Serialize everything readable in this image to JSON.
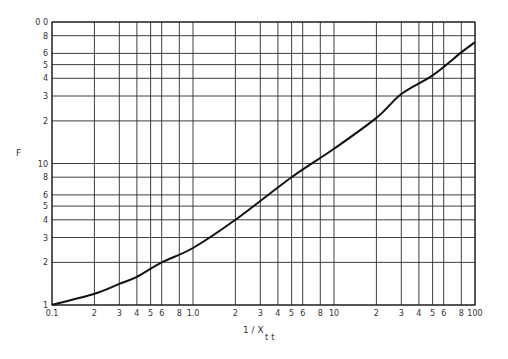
{
  "chart_data": {
    "type": "line",
    "title": "",
    "xlabel": "1 / X",
    "xlabel_subscript": "tt",
    "ylabel": "F",
    "xscale": "log",
    "yscale": "log",
    "xlim": [
      0.1,
      100
    ],
    "ylim": [
      1,
      100
    ],
    "grid": true,
    "legend": null,
    "x_ticks": [
      {
        "v": 0.1,
        "label": "0.1"
      },
      {
        "v": 0.2,
        "label": "2"
      },
      {
        "v": 0.3,
        "label": "3"
      },
      {
        "v": 0.4,
        "label": "4"
      },
      {
        "v": 0.5,
        "label": "5"
      },
      {
        "v": 0.6,
        "label": "6"
      },
      {
        "v": 0.8,
        "label": "8"
      },
      {
        "v": 1.0,
        "label": "1.0"
      },
      {
        "v": 2,
        "label": "2"
      },
      {
        "v": 3,
        "label": "3"
      },
      {
        "v": 4,
        "label": "4"
      },
      {
        "v": 5,
        "label": "5"
      },
      {
        "v": 6,
        "label": "6"
      },
      {
        "v": 8,
        "label": "8"
      },
      {
        "v": 10,
        "label": "10"
      },
      {
        "v": 20,
        "label": "2"
      },
      {
        "v": 30,
        "label": "3"
      },
      {
        "v": 40,
        "label": "4"
      },
      {
        "v": 50,
        "label": "5"
      },
      {
        "v": 60,
        "label": "6"
      },
      {
        "v": 80,
        "label": "8"
      },
      {
        "v": 100,
        "label": "100"
      }
    ],
    "y_ticks": [
      {
        "v": 1,
        "label": "1"
      },
      {
        "v": 2,
        "label": "2"
      },
      {
        "v": 3,
        "label": "3"
      },
      {
        "v": 4,
        "label": "4"
      },
      {
        "v": 5,
        "label": "5"
      },
      {
        "v": 6,
        "label": "6"
      },
      {
        "v": 8,
        "label": "8"
      },
      {
        "v": 10,
        "label": "10"
      },
      {
        "v": 20,
        "label": "2"
      },
      {
        "v": 30,
        "label": "3"
      },
      {
        "v": 40,
        "label": "4"
      },
      {
        "v": 50,
        "label": "5"
      },
      {
        "v": 60,
        "label": "6"
      },
      {
        "v": 80,
        "label": "8"
      },
      {
        "v": 100,
        "label": "0 0"
      }
    ],
    "series": [
      {
        "name": "F",
        "x": [
          0.1,
          0.2,
          0.3,
          0.4,
          0.6,
          1.0,
          2,
          5,
          10,
          20,
          30,
          50,
          80,
          100
        ],
        "y": [
          1.0,
          1.2,
          1.41,
          1.58,
          2.0,
          2.53,
          4.0,
          8.0,
          12.7,
          21,
          31,
          42,
          61,
          72
        ]
      }
    ]
  }
}
